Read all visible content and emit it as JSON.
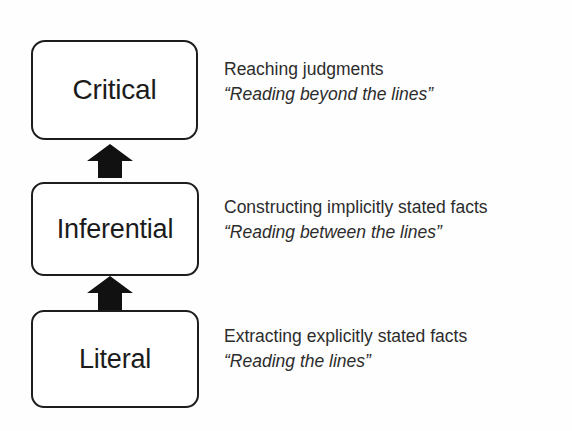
{
  "diagram": {
    "orientation": "bottom-to-top",
    "background_color": "#fefefe",
    "box_border_color": "#1d1d1d",
    "box_fill_color": "#ffffff",
    "arrow_color": "#111111",
    "text_color": "#2c2c2c",
    "levels": [
      {
        "id": "critical",
        "label": "Critical",
        "order": 3,
        "description": "Reaching judgments",
        "quote": "“Reading beyond the lines”"
      },
      {
        "id": "inferential",
        "label": "Inferential",
        "order": 2,
        "description": "Constructing implicitly stated facts",
        "quote": "“Reading between the lines”"
      },
      {
        "id": "literal",
        "label": "Literal",
        "order": 1,
        "description": "Extracting explicitly stated facts",
        "quote": "“Reading the lines”"
      }
    ],
    "arrows": [
      {
        "id": "literal-to-inferential",
        "from": "literal",
        "to": "inferential",
        "direction": "up"
      },
      {
        "id": "inferential-to-critical",
        "from": "inferential",
        "to": "critical",
        "direction": "up"
      }
    ]
  }
}
